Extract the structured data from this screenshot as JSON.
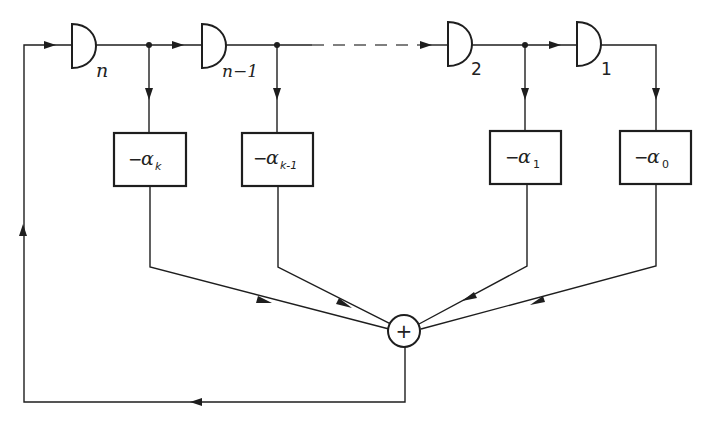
{
  "diagram": {
    "type": "linear feedback shift register",
    "delays": [
      {
        "id": "n",
        "label": "n"
      },
      {
        "id": "n-1",
        "label": "n−1"
      },
      {
        "id": "2",
        "label": "2"
      },
      {
        "id": "1",
        "label": "1"
      }
    ],
    "coefficients": [
      {
        "id": "k",
        "sign": "−",
        "symbol": "α",
        "subscript": "k"
      },
      {
        "id": "k-1",
        "sign": "−",
        "symbol": "α",
        "subscript": "k-1"
      },
      {
        "id": "1",
        "sign": "−",
        "symbol": "α",
        "subscript": "1"
      },
      {
        "id": "0",
        "sign": "−",
        "symbol": "α",
        "subscript": "0"
      }
    ],
    "adder": {
      "symbol": "+"
    }
  }
}
